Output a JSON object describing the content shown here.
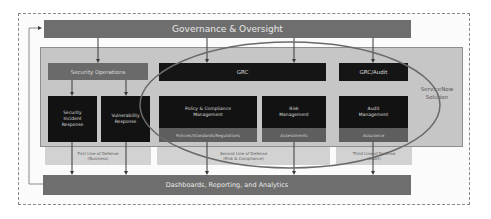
{
  "diagram": {
    "top_bar": {
      "label": "Governance & Oversight"
    },
    "bottom_bar": {
      "label": "Dashboards, Reporting, and Analytics"
    },
    "side_label": {
      "line1": "ServiceNow",
      "line2": "Solution"
    },
    "columns": [
      {
        "header": "Security Operations",
        "boxes": [
          {
            "title": "Security Incident Response",
            "lines": [
              "Security",
              "Incident",
              "Response"
            ]
          },
          {
            "title": "Vulnerability Response",
            "lines": [
              "Vulnerability",
              "Response"
            ]
          }
        ],
        "caption": {
          "line1": "First Line of Defense",
          "line2": "(Business)"
        }
      },
      {
        "header": "GRC",
        "boxes": [
          {
            "title": "Policy & Compliance Management",
            "lines": [
              "Policy & Compliance",
              "Management"
            ],
            "sub": "Policies/Standards/Regulations"
          },
          {
            "title": "Risk Management",
            "lines": [
              "Risk",
              "Management"
            ],
            "sub": "Assessments"
          }
        ],
        "caption": {
          "line1": "Second Line of Defense",
          "line2": "(Risk & Compliance)"
        }
      },
      {
        "header": "GRC/Audit",
        "boxes": [
          {
            "title": "Audit Management",
            "lines": [
              "Audit",
              "Management"
            ],
            "sub": "Assurance"
          }
        ],
        "caption": {
          "line1": "Third Line of Defense",
          "line2": "(Audit)"
        }
      }
    ],
    "colors": {
      "dark_bar": "#6e6e6e",
      "black_box": "#121212",
      "panel": "#c6c6c6",
      "ellipse": "#6a6a6a"
    }
  }
}
